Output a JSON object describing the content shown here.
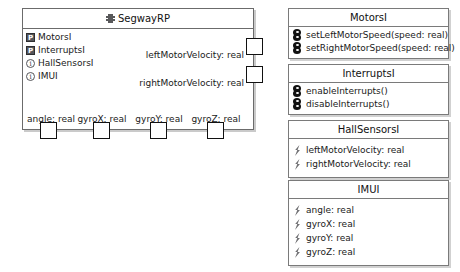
{
  "diagram": {
    "type": "uml-component-diagram",
    "colors": {
      "background": "#ffffff",
      "border": "#6b6b6b",
      "panel_border": "#7a7a7a",
      "port_border": "#111111",
      "provided_icon_fill": "#55565a",
      "operation_icon_fill": "#111111",
      "attribute_icon_fill": "#6f6f72",
      "text": "#1a1a1a"
    }
  },
  "component": {
    "name": "SegwayRP",
    "icon": "component-icon",
    "interfaces": [
      {
        "label": "MotorsI",
        "icon": "provided-interface-icon",
        "glyph": "P"
      },
      {
        "label": "InterruptsI",
        "icon": "provided-interface-icon",
        "glyph": "P"
      },
      {
        "label": "HallSensorsI",
        "icon": "required-interface-icon",
        "glyph": "i"
      },
      {
        "label": "IMUI",
        "icon": "required-interface-icon",
        "glyph": "i"
      }
    ],
    "right_ports": [
      {
        "label": "leftMotorVelocity: real"
      },
      {
        "label": "rightMotorVelocity: real"
      }
    ],
    "bottom_ports": [
      {
        "label": "angle: real"
      },
      {
        "label": "gyroX: real"
      },
      {
        "label": "gyroY: real"
      },
      {
        "label": "gyroZ: real"
      }
    ]
  },
  "interface_panels": [
    {
      "title": "MotorsI",
      "members": [
        {
          "label": "setLeftMotorSpeed(speed: real)",
          "icon": "operation-icon"
        },
        {
          "label": "setRightMotorSpeed(speed: real)",
          "icon": "operation-icon"
        }
      ]
    },
    {
      "title": "InterruptsI",
      "members": [
        {
          "label": "enableInterrupts()",
          "icon": "operation-icon"
        },
        {
          "label": "disableInterrupts()",
          "icon": "operation-icon"
        }
      ]
    },
    {
      "title": "HallSensorsI",
      "members": [
        {
          "label": "leftMotorVelocity: real",
          "icon": "attribute-icon"
        },
        {
          "label": "rightMotorVelocity: real",
          "icon": "attribute-icon"
        }
      ]
    },
    {
      "title": "IMUI",
      "members": [
        {
          "label": "angle: real",
          "icon": "attribute-icon"
        },
        {
          "label": "gyroX: real",
          "icon": "attribute-icon"
        },
        {
          "label": "gyroY: real",
          "icon": "attribute-icon"
        },
        {
          "label": "gyroZ: real",
          "icon": "attribute-icon"
        }
      ]
    }
  ]
}
